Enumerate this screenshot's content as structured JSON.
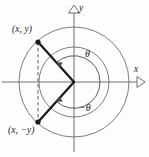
{
  "figure": {
    "background_color": "#fdfdfd",
    "stroke_color": "#5a5a5a",
    "bold_stroke_color": "#1b1b1b",
    "text_color": "#1b1b1b"
  },
  "axes": {
    "x_label": "x",
    "y_label": "y",
    "origin": {
      "x": 74,
      "y": 82
    },
    "x_arrow": "hollow-triangle-right",
    "y_arrow": "hollow-triangle-up"
  },
  "labels": {
    "point_upper": "(x, y)",
    "point_lower": "(x, −y)",
    "angle_positive": "θ",
    "angle_negative": "−θ"
  },
  "points": [
    {
      "name": "upper-point",
      "label": "(x, y)",
      "x": 38,
      "y": 42
    },
    {
      "name": "lower-point",
      "label": "(x, −y)",
      "x": 38,
      "y": 122
    }
  ],
  "circles": [
    {
      "name": "outer-circle",
      "cx": 74,
      "cy": 82,
      "r": 55
    },
    {
      "name": "inner-circle",
      "cx": 74,
      "cy": 82,
      "r": 35
    }
  ],
  "rays": [
    {
      "name": "ray-to-upper-point",
      "from": "origin",
      "to": "upper-point"
    },
    {
      "name": "ray-to-lower-point",
      "from": "origin",
      "to": "lower-point"
    }
  ],
  "dashed_segment": {
    "name": "vertical-dashed-connector",
    "from": "upper-point",
    "to": "lower-point"
  },
  "angle_arcs": [
    {
      "name": "theta-arc",
      "label": "θ",
      "direction": "counterclockwise",
      "from_deg": 0,
      "to_deg": 132,
      "radius": 26
    },
    {
      "name": "negative-theta-arc",
      "label": "−θ",
      "direction": "clockwise",
      "from_deg": 0,
      "to_deg": -132,
      "radius": 26
    }
  ]
}
